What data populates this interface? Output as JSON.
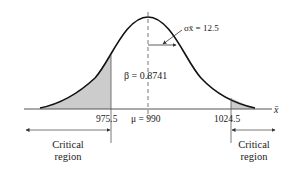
{
  "diagram": {
    "type": "normal-distribution-hypothesis-test",
    "curve_color": "#111111",
    "shade_color": "#cccccc",
    "axis_label": "x̄",
    "sigma_label": "σx̄ = 12.5",
    "beta_label": "β = 0.8741",
    "ticks": {
      "left_critical": "975.5",
      "mean": "μ = 990",
      "right_critical": "1024.5"
    },
    "regions": {
      "left": {
        "line1": "Critical",
        "line2": "region"
      },
      "right": {
        "line1": "Critical",
        "line2": "region"
      }
    }
  }
}
